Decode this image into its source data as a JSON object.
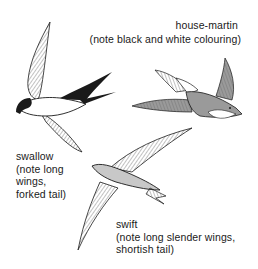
{
  "figure": {
    "birds": [
      {
        "id": "swallow",
        "name": "swallow",
        "note_lines": [
          "(note long",
          "wings,",
          "forked tail)"
        ]
      },
      {
        "id": "house-martin",
        "name": "house-martin",
        "note_lines": [
          "(note black and white colouring)"
        ]
      },
      {
        "id": "swift",
        "name": "swift",
        "note_lines": [
          "(note long slender wings,",
          "shortish tail)"
        ]
      }
    ]
  },
  "colors": {
    "ink": "#1a1a1a",
    "house_martin_fill": "#9a9a9a",
    "swift_fill": "#c8c8c8",
    "paper": "#ffffff"
  }
}
